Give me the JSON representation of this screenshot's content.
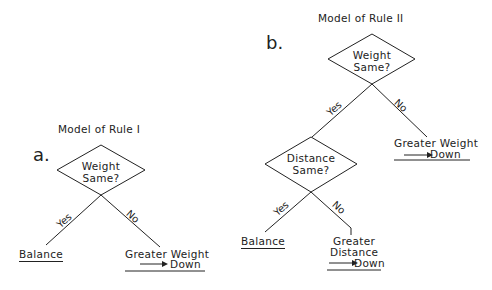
{
  "panel_a": {
    "letter": "a.",
    "title": "Model of Rule I",
    "decision": {
      "line1": "Weight",
      "line2": "Same?"
    },
    "yes_label": "Yes",
    "no_label": "No",
    "yes_outcome": "Balance",
    "no_outcome": {
      "line1": "Greater Weight",
      "line2": "Down"
    }
  },
  "panel_b": {
    "letter": "b.",
    "title": "Model of Rule II",
    "decision1": {
      "line1": "Weight",
      "line2": "Same?"
    },
    "yes1_label": "Yes",
    "no1_label": "No",
    "no1_outcome": {
      "line1": "Greater Weight",
      "line2": "Down"
    },
    "decision2": {
      "line1": "Distance",
      "line2": "Same?"
    },
    "yes2_label": "Yes",
    "no2_label": "No",
    "yes2_outcome": "Balance",
    "no2_outcome": {
      "line1": "Greater",
      "line2": "Distance",
      "line3": "Down"
    }
  }
}
